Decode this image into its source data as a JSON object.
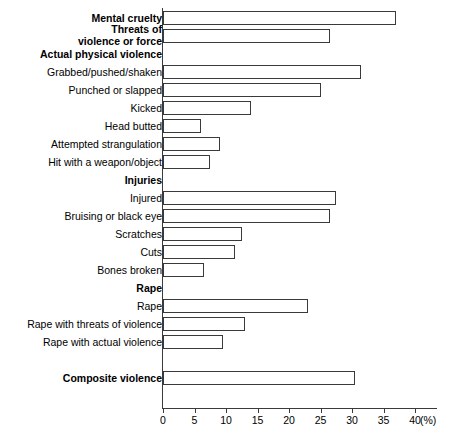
{
  "chart_data": {
    "type": "bar",
    "orientation": "horizontal",
    "title": "",
    "xlabel": "(%)",
    "ylabel": "",
    "xlim": [
      0,
      40
    ],
    "xticks": [
      0,
      5,
      10,
      15,
      20,
      25,
      30,
      35,
      40
    ],
    "unit": "(%)",
    "grid": false,
    "legend": null,
    "axis_color": "#3a3a3a",
    "bar_fill": "#ffffff",
    "bar_edge": "#3a3a3a",
    "rows": [
      {
        "label": "Mental cruelty",
        "value": 37.0,
        "bold": true,
        "bar": true,
        "two_line": false
      },
      {
        "label": "Threats of\nviolence or force",
        "value": 26.5,
        "bold": true,
        "bar": true,
        "two_line": true
      },
      {
        "label": "Actual physical violence",
        "value": null,
        "bold": true,
        "bar": false,
        "two_line": false
      },
      {
        "label": "Grabbed/pushed/shaken",
        "value": 31.5,
        "bold": false,
        "bar": true,
        "two_line": false
      },
      {
        "label": "Punched or slapped",
        "value": 25.0,
        "bold": false,
        "bar": true,
        "two_line": false
      },
      {
        "label": "Kicked",
        "value": 14.0,
        "bold": false,
        "bar": true,
        "two_line": false
      },
      {
        "label": "Head butted",
        "value": 6.0,
        "bold": false,
        "bar": true,
        "two_line": false
      },
      {
        "label": "Attempted strangulation",
        "value": 9.0,
        "bold": false,
        "bar": true,
        "two_line": false
      },
      {
        "label": "Hit with a weapon/object",
        "value": 7.5,
        "bold": false,
        "bar": true,
        "two_line": false
      },
      {
        "label": "Injuries",
        "value": null,
        "bold": true,
        "bar": false,
        "two_line": false
      },
      {
        "label": "Injured",
        "value": 27.5,
        "bold": false,
        "bar": true,
        "two_line": false
      },
      {
        "label": "Bruising or black eye",
        "value": 26.5,
        "bold": false,
        "bar": true,
        "two_line": false
      },
      {
        "label": "Scratches",
        "value": 12.5,
        "bold": false,
        "bar": true,
        "two_line": false
      },
      {
        "label": "Cuts",
        "value": 11.5,
        "bold": false,
        "bar": true,
        "two_line": false
      },
      {
        "label": "Bones broken",
        "value": 6.5,
        "bold": false,
        "bar": true,
        "two_line": false
      },
      {
        "label": "Rape",
        "value": null,
        "bold": true,
        "bar": false,
        "two_line": false
      },
      {
        "label": "Rape",
        "value": 23.0,
        "bold": false,
        "bar": true,
        "two_line": false
      },
      {
        "label": "Rape with threats of violence",
        "value": 13.0,
        "bold": false,
        "bar": true,
        "two_line": false
      },
      {
        "label": "Rape with actual violence",
        "value": 9.5,
        "bold": false,
        "bar": true,
        "two_line": false
      },
      {
        "label": "",
        "value": null,
        "bold": false,
        "bar": false,
        "two_line": false
      },
      {
        "label": "Composite violence",
        "value": 30.5,
        "bold": true,
        "bar": true,
        "two_line": false
      }
    ],
    "categories": [
      "Mental cruelty",
      "Threats of violence or force",
      "Grabbed/pushed/shaken",
      "Punched or slapped",
      "Kicked",
      "Head butted",
      "Attempted strangulation",
      "Hit with a weapon/object",
      "Injured",
      "Bruising or black eye",
      "Scratches",
      "Cuts",
      "Bones broken",
      "Rape",
      "Rape with threats of violence",
      "Rape with actual violence",
      "Composite violence"
    ],
    "values": [
      37.0,
      26.5,
      31.5,
      25.0,
      14.0,
      6.0,
      9.0,
      7.5,
      27.5,
      26.5,
      12.5,
      11.5,
      6.5,
      23.0,
      13.0,
      9.5,
      30.5
    ],
    "group_headers": [
      "Actual physical violence",
      "Injuries",
      "Rape"
    ]
  }
}
